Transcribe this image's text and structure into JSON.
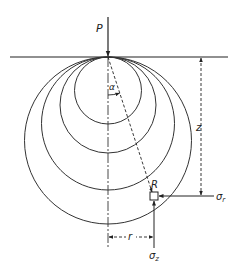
{
  "diagram": {
    "type": "stress-bulb",
    "labels": {
      "load": "P",
      "angle": "α",
      "point": "R",
      "depth": "z",
      "radial_distance": "r",
      "radial_stress": "σ",
      "radial_stress_sub": "r",
      "vertical_stress": "σ",
      "vertical_stress_sub": "z"
    },
    "colors": {
      "line": "#222222",
      "background": "#ffffff"
    },
    "surface": {
      "y": 57,
      "x1": 10,
      "x2": 228
    },
    "load_point": {
      "x": 108,
      "y": 57
    },
    "circles_diameters": [
      67,
      96,
      133,
      167
    ],
    "point_R": {
      "x": 154,
      "y": 196
    }
  }
}
